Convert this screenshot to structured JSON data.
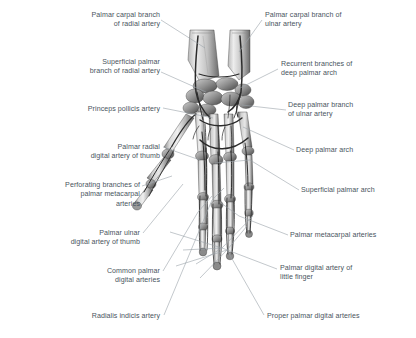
{
  "figure": {
    "name": "palmar-hand-arteries-anatomical-illustration",
    "background_color": "#ffffff",
    "bone_light": "#e8e8e8",
    "bone_mid": "#a8a8a8",
    "bone_dark": "#4a4a4a",
    "vessel_color": "#2b2b2b"
  },
  "style": {
    "label_color": "#4a5560",
    "leader_color": "#9aa2aa",
    "leader_width": 0.6
  },
  "labels": [
    {
      "id": "palmar-carpal-branch-of-radial-artery",
      "text": "Palmar carpal branch\nof radial artery",
      "align": "right",
      "x": 60,
      "y": 11,
      "w": 100,
      "leader": [
        [
          161,
          20
        ],
        [
          205,
          48
        ]
      ]
    },
    {
      "id": "palmar-carpal-branch-of-ulnar-artery",
      "text": "Palmar carpal branch of\nulnar artery",
      "align": "left",
      "x": 265,
      "y": 11,
      "w": 120,
      "leader": [
        [
          262,
          20
        ],
        [
          239,
          52
        ]
      ]
    },
    {
      "id": "superficial-palmar-branch-of-radial-artery",
      "text": "Superficial palmar\nbranch of radial artery",
      "align": "right",
      "x": 48,
      "y": 58,
      "w": 112,
      "leader": [
        [
          161,
          72
        ],
        [
          206,
          92
        ]
      ]
    },
    {
      "id": "recurrent-branches-of-deep-palmar-arch",
      "text": "Recurrent branches of\ndeep palmar arch",
      "align": "left",
      "x": 281,
      "y": 60,
      "w": 124,
      "leader": [
        [
          278,
          69
        ],
        [
          240,
          88
        ]
      ]
    },
    {
      "id": "princeps-pollicis-artery",
      "text": "Princeps pollicis artery",
      "align": "right",
      "x": 28,
      "y": 105,
      "w": 132,
      "leader": [
        [
          163,
          108
        ],
        [
          213,
          118
        ]
      ]
    },
    {
      "id": "deep-palmar-branch-of-ulnar-artery",
      "text": "Deep palmar branch\nof ulnar artery",
      "align": "left",
      "x": 288,
      "y": 101,
      "w": 118,
      "leader": [
        [
          286,
          110
        ],
        [
          242,
          105
        ]
      ]
    },
    {
      "id": "palmar-radial-digital-artery-of-thumb",
      "text": "Palmar radial\ndigital artery of thumb",
      "align": "right",
      "x": 22,
      "y": 143,
      "w": 138,
      "leader": [
        [
          163,
          147
        ],
        [
          200,
          160
        ]
      ]
    },
    {
      "id": "deep-palmar-arch",
      "text": "Deep palmar arch",
      "align": "left",
      "x": 296,
      "y": 146,
      "w": 100,
      "leader": [
        [
          294,
          150
        ],
        [
          243,
          127
        ]
      ]
    },
    {
      "id": "perforating-branches-of-palmar-metacarpal-arteries",
      "text": "Perforating branches of\npalmar metacarpal\narteries",
      "align": "right",
      "x": 14,
      "y": 181,
      "w": 126,
      "leader": [
        [
          142,
          186
        ],
        [
          172,
          176
        ]
      ]
    },
    {
      "id": "superficial-palmar-arch",
      "text": "Superficial palmar arch",
      "align": "left",
      "x": 301,
      "y": 186,
      "w": 112,
      "leader": [
        [
          299,
          190
        ],
        [
          250,
          160
        ]
      ]
    },
    {
      "id": "palmar-ulnar-digital-artery-of-thumb",
      "text": "Palmar ulnar\ndigital artery of thumb",
      "align": "right",
      "x": 22,
      "y": 229,
      "w": 118,
      "leader": [
        [
          143,
          233
        ],
        [
          183,
          184
        ]
      ]
    },
    {
      "id": "palmar-metacarpal-arteries",
      "text": "Palmar metacarpal arteries",
      "align": "left",
      "x": 290,
      "y": 231,
      "w": 126,
      "leader": [
        [
          288,
          235
        ],
        [
          239,
          216
        ]
      ]
    },
    {
      "id": "common-palmar-digital-arteries",
      "text": "Common palmar\ndigital arteries",
      "align": "right",
      "x": 58,
      "y": 267,
      "w": 102,
      "leader": [
        [
          163,
          271
        ],
        [
          198,
          212
        ]
      ]
    },
    {
      "id": "palmar-digital-artery-of-little-finger",
      "text": "Palmar digital artery of\nlittle finger",
      "align": "left",
      "x": 280,
      "y": 264,
      "w": 126,
      "leader": [
        [
          277,
          269
        ],
        [
          222,
          248
        ]
      ]
    },
    {
      "id": "radialis-indicis-artery",
      "text": "Radialis indicis artery",
      "align": "right",
      "x": 58,
      "y": 312,
      "w": 102,
      "leader": [
        [
          164,
          315
        ],
        [
          212,
          200
        ]
      ]
    },
    {
      "id": "proper-palmar-digital-arteries",
      "text": "Proper palmar digital arteries",
      "align": "left",
      "x": 267,
      "y": 312,
      "w": 140,
      "leader": [
        [
          264,
          315
        ],
        [
          227,
          250
        ]
      ]
    }
  ],
  "extra_leaders": [
    [
      [
        222,
        248
      ],
      [
        170,
        232
      ]
    ],
    [
      [
        222,
        248
      ],
      [
        183,
        250
      ]
    ],
    [
      [
        222,
        248
      ],
      [
        196,
        264
      ]
    ],
    [
      [
        222,
        248
      ],
      [
        253,
        216
      ]
    ],
    [
      [
        227,
        250
      ],
      [
        176,
        266
      ]
    ],
    [
      [
        227,
        250
      ],
      [
        200,
        278
      ]
    ],
    [
      [
        227,
        250
      ],
      [
        247,
        226
      ]
    ],
    [
      [
        239,
        216
      ],
      [
        221,
        203
      ]
    ],
    [
      [
        250,
        160
      ],
      [
        215,
        163
      ]
    ],
    [
      [
        198,
        212
      ],
      [
        212,
        196
      ]
    ],
    [
      [
        212,
        200
      ],
      [
        224,
        188
      ]
    ]
  ]
}
